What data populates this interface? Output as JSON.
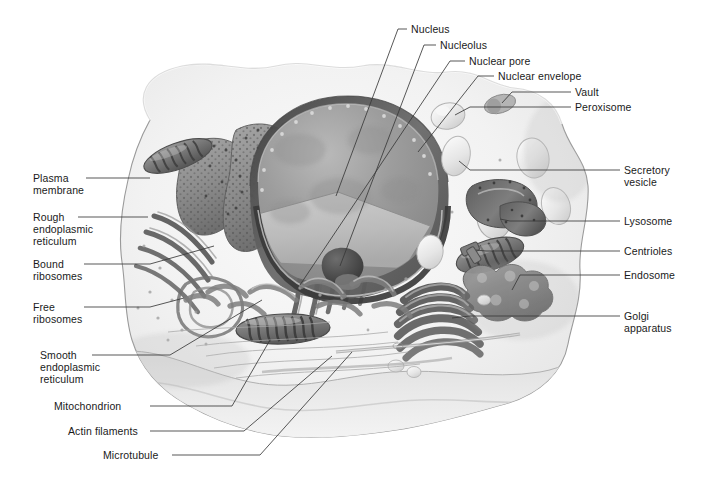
{
  "figure": {
    "background_color": "#ffffff",
    "text_color": "#1a1a1a",
    "leader_color": "#3a3a3a",
    "width": 706,
    "height": 485
  },
  "labels": {
    "nucleus": "Nucleus",
    "nucleolus": "Nucleolus",
    "nuclear_pore": "Nuclear pore",
    "nuclear_envelope": "Nuclear envelope",
    "vault": "Vault",
    "peroxisome": "Peroxisome",
    "secretory_vesicle": "Secretory\nvesicle",
    "lysosome": "Lysosome",
    "centrioles": "Centrioles",
    "endosome": "Endosome",
    "golgi_apparatus": "Golgi\napparatus",
    "plasma_membrane": "Plasma\nmembrane",
    "rough_er": "Rough\nendoplasmic\nreticulum",
    "bound_ribosomes": "Bound\nribosomes",
    "free_ribosomes": "Free\nribosomes",
    "smooth_er": "Smooth\nendoplasmic\nreticulum",
    "mitochondrion": "Mitochondrion",
    "actin_filaments": "Actin filaments",
    "microtubule": "Microtubule"
  },
  "label_positions": {
    "nucleus": {
      "x": 411,
      "y": 23,
      "side": "right"
    },
    "nucleolus": {
      "x": 440,
      "y": 39,
      "side": "right"
    },
    "nuclear_pore": {
      "x": 469,
      "y": 55,
      "side": "right"
    },
    "nuclear_envelope": {
      "x": 498,
      "y": 70,
      "side": "right"
    },
    "vault": {
      "x": 575,
      "y": 86,
      "side": "right"
    },
    "peroxisome": {
      "x": 575,
      "y": 101,
      "side": "right"
    },
    "secretory_vesicle": {
      "x": 624,
      "y": 164,
      "side": "right"
    },
    "lysosome": {
      "x": 624,
      "y": 215,
      "side": "right"
    },
    "centrioles": {
      "x": 624,
      "y": 245,
      "side": "right"
    },
    "endosome": {
      "x": 624,
      "y": 269,
      "side": "right"
    },
    "golgi_apparatus": {
      "x": 624,
      "y": 310,
      "side": "right"
    },
    "plasma_membrane": {
      "x": 33,
      "y": 172,
      "side": "left"
    },
    "rough_er": {
      "x": 33,
      "y": 211,
      "side": "left"
    },
    "bound_ribosomes": {
      "x": 33,
      "y": 258,
      "side": "left"
    },
    "free_ribosomes": {
      "x": 33,
      "y": 301,
      "side": "left"
    },
    "smooth_er": {
      "x": 40,
      "y": 349,
      "side": "left"
    },
    "mitochondrion": {
      "x": 54,
      "y": 400,
      "side": "left"
    },
    "actin_filaments": {
      "x": 68,
      "y": 425,
      "side": "left"
    },
    "microtubule": {
      "x": 103,
      "y": 449,
      "side": "left"
    }
  },
  "organelles": [
    {
      "name": "nucleus",
      "description": "large sectioned sphere, center of cell"
    },
    {
      "name": "nucleolus",
      "description": "dark dense body inside nucleus"
    },
    {
      "name": "nuclear pore",
      "description": "gaps in nuclear envelope"
    },
    {
      "name": "nuclear envelope",
      "description": "double membrane around nucleus"
    },
    {
      "name": "vault",
      "description": "small barrel organelle, upper right"
    },
    {
      "name": "peroxisome",
      "description": "small round vesicle, upper right"
    },
    {
      "name": "secretory vesicle",
      "description": "oval vesicle near membrane, right"
    },
    {
      "name": "lysosome",
      "description": "oval vesicle, right"
    },
    {
      "name": "centrioles",
      "description": "paired short cylinders, right of center"
    },
    {
      "name": "endosome",
      "description": "irregular lobed vesicle, right"
    },
    {
      "name": "golgi apparatus",
      "description": "stack of curved flattened cisternae, lower right"
    },
    {
      "name": "plasma membrane",
      "description": "outer boundary of the cell"
    },
    {
      "name": "rough endoplasmic reticulum",
      "description": "ribosome-studded folded sheets, left"
    },
    {
      "name": "bound ribosomes",
      "description": "dots on rough ER surface"
    },
    {
      "name": "free ribosomes",
      "description": "scattered dots in cytosol"
    },
    {
      "name": "smooth endoplasmic reticulum",
      "description": "tubular network without ribosomes"
    },
    {
      "name": "mitochondrion",
      "description": "oval organelle with cristae"
    },
    {
      "name": "actin filaments",
      "description": "fine thin fibers in cytosol"
    },
    {
      "name": "microtubule",
      "description": "long straight hollow tube"
    }
  ]
}
